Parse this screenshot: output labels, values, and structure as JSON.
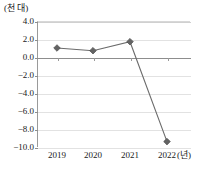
{
  "chart_data": {
    "type": "line",
    "title": "",
    "subtitle": "",
    "xlabel": "(년)",
    "ylabel": "(천 대)",
    "categories": [
      "2019",
      "2020",
      "2021",
      "2022"
    ],
    "series": [
      {
        "name": "",
        "values": [
          1.0,
          0.7,
          1.7,
          -9.4
        ]
      }
    ],
    "ylim": [
      -10.0,
      4.0
    ],
    "ytick_labels": [
      "4.0",
      "2.0",
      "0.0",
      "−2.0",
      "−4.0",
      "−6.0",
      "−8.0",
      "−10.0"
    ],
    "ytick_values": [
      4.0,
      2.0,
      0.0,
      -2.0,
      -4.0,
      -6.0,
      -8.0,
      -10.0
    ],
    "grid": true,
    "legend": "none",
    "marker": "diamond",
    "line_color": "#6b6b6b",
    "marker_color": "#636363",
    "grid_color": "#e2e2e2",
    "axis_color": "#8d8d8d"
  },
  "axes": {
    "y_unit": "(천 대)",
    "x_unit": "(년)"
  }
}
